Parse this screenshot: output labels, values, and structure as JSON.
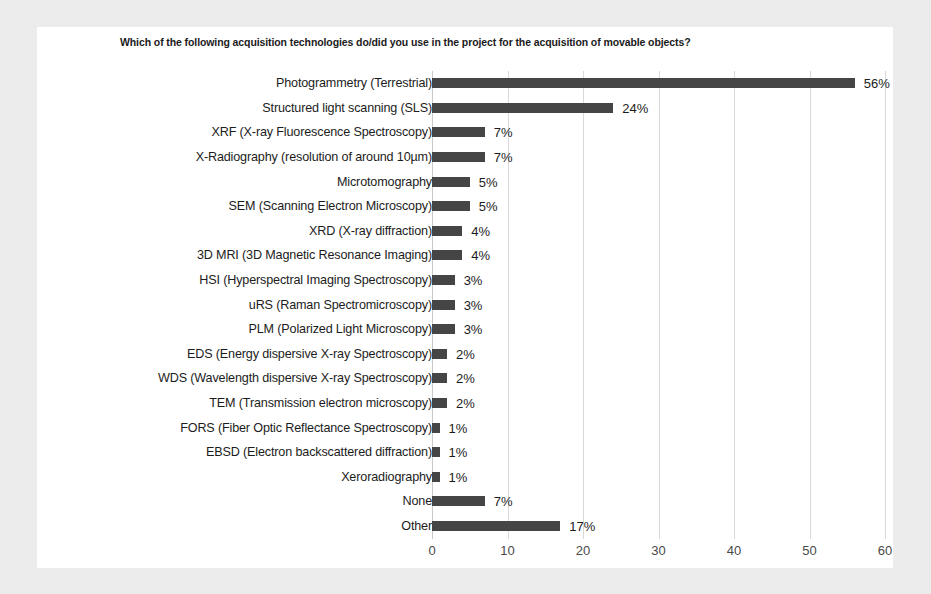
{
  "chart_data": {
    "type": "bar",
    "orientation": "horizontal",
    "title": "Which of the following acquisition technologies do/did you use in the project for the acquisition of movable objects?",
    "xlabel": "",
    "ylabel": "",
    "xlim": [
      0,
      60
    ],
    "xticks": [
      0,
      10,
      20,
      30,
      40,
      50,
      60
    ],
    "grid": true,
    "legend": false,
    "bar_color": "#454545",
    "value_suffix": "%",
    "categories": [
      "Photogrammetry (Terrestrial)",
      "Structured light scanning (SLS)",
      "XRF (X-ray Fluorescence Spectroscopy)",
      "X-Radiography (resolution of around 10µm)",
      "Microtomography",
      "SEM (Scanning Electron Microscopy)",
      "XRD (X-ray diffraction)",
      "3D MRI (3D Magnetic Resonance Imaging)",
      "HSI (Hyperspectral Imaging Spectroscopy)",
      "uRS (Raman Spectromicroscopy)",
      "PLM (Polarized Light Microscopy)",
      "EDS (Energy dispersive X-ray Spectroscopy)",
      "WDS (Wavelength dispersive X-ray Spectroscopy)",
      "TEM (Transmission electron microscopy)",
      "FORS (Fiber Optic Reflectance Spectroscopy)",
      "EBSD (Electron backscattered diffraction)",
      "Xeroradiography",
      "None",
      "Other"
    ],
    "values": [
      56,
      24,
      7,
      7,
      5,
      5,
      4,
      4,
      3,
      3,
      3,
      2,
      2,
      2,
      1,
      1,
      1,
      7,
      17
    ],
    "data_labels": [
      "56%",
      "24%",
      "7%",
      "7%",
      "5%",
      "5%",
      "4%",
      "4%",
      "3%",
      "3%",
      "3%",
      "2%",
      "2%",
      "2%",
      "1%",
      "1%",
      "1%",
      "7%",
      "17%"
    ],
    "xtick_labels": [
      "0",
      "10",
      "20",
      "30",
      "40",
      "50",
      "60"
    ]
  }
}
